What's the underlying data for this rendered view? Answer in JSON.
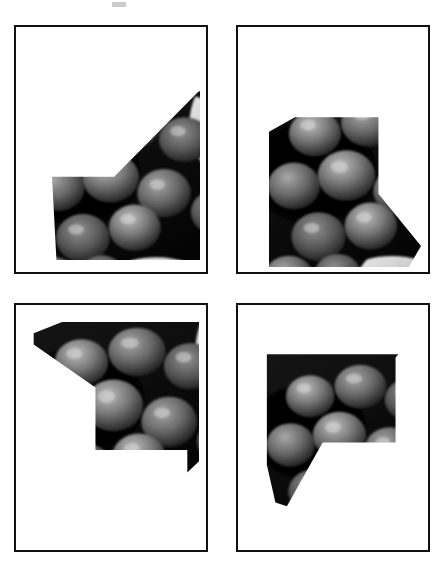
{
  "document": {
    "title": "Grayscale photo fragment worksheet",
    "background_color": "#ffffff",
    "width": 432,
    "height": 564,
    "description": "Four bordered rectangular panels arranged in a 2x2 grid, each containing an irregular polygonal crop of the same grayscale photograph of clustered grapes and leaves."
  },
  "artifact": {
    "name": "scan-speck",
    "left": 112,
    "top": 2,
    "width": 14,
    "height": 5
  },
  "photo": {
    "subject": "grapes-and-leaves",
    "mode": "grayscale",
    "dark_tone": "#1b1b1b",
    "mid_tone": "#5c5c5c",
    "light_tone": "#c9c9c9",
    "highlight_tone": "#e4e4e2"
  },
  "frame": {
    "border_color": "#111111",
    "border_width": 2,
    "fill_color": "#ffffff"
  },
  "panels": [
    {
      "id": "panel-top-left",
      "label": "Panel 1",
      "frame": {
        "left": 14,
        "top": 25,
        "width": 194,
        "height": 249
      },
      "fragment": {
        "label": "Fragment 1",
        "left": 36,
        "top": 63,
        "width": 148,
        "height": 170,
        "clip": "polygon(0% 51%, 42% 51%, 100% 0%, 100% 100%, 3% 100%)",
        "photo_offset_x": -26,
        "photo_offset_y": -18,
        "photo_scale": 175
      }
    },
    {
      "id": "panel-top-right",
      "label": "Panel 2",
      "frame": {
        "left": 236,
        "top": 25,
        "width": 194,
        "height": 249
      },
      "fragment": {
        "label": "Fragment 2",
        "left": 31,
        "top": 82,
        "width": 152,
        "height": 163,
        "clip": "polygon(0% 14%, 17% 5%, 72% 5%, 72% 52%, 100% 84%, 92% 97%, 47% 97%, 0% 97%)",
        "photo_offset_x": -8,
        "photo_offset_y": -30,
        "photo_scale": 172
      }
    },
    {
      "id": "panel-bottom-left",
      "label": "Panel 3",
      "frame": {
        "left": 14,
        "top": 303,
        "width": 194,
        "height": 249
      },
      "fragment": {
        "label": "Fragment 3",
        "left": 16,
        "top": 17,
        "width": 167,
        "height": 160,
        "clip": "polygon(1% 7%, 18% 0%, 100% 0%, 100% 87%, 93% 94%, 93% 80%, 38% 80%, 38% 41%, 1% 14%)",
        "photo_offset_x": -12,
        "photo_offset_y": -6,
        "photo_scale": 168
      }
    },
    {
      "id": "panel-bottom-right",
      "label": "Panel 4",
      "frame": {
        "left": 236,
        "top": 303,
        "width": 194,
        "height": 249
      },
      "fragment": {
        "label": "Fragment 4",
        "left": 26,
        "top": 19,
        "width": 143,
        "height": 188,
        "clip": "polygon(2% 5%, 93% 5%, 100% 10%, 92% 18%, 92% 63%, 41% 63%, 16% 97%, 8% 95%, 2% 75%)",
        "photo_offset_x": -4,
        "photo_offset_y": -8,
        "photo_scale": 170
      }
    }
  ]
}
